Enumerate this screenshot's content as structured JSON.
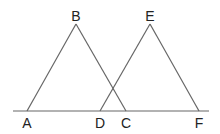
{
  "diagram": {
    "type": "geometry",
    "colors": {
      "line": "#666666",
      "label": "#222222",
      "background": "#ffffff"
    },
    "baseline": {
      "from": [
        13,
        111
      ],
      "to": [
        209,
        111
      ]
    },
    "points": {
      "A": {
        "label": "A",
        "x": 27,
        "y": 111,
        "lx": 27,
        "ly": 123
      },
      "B": {
        "label": "B",
        "x": 76,
        "y": 24,
        "lx": 76,
        "ly": 16
      },
      "C": {
        "label": "C",
        "x": 126,
        "y": 111,
        "lx": 126,
        "ly": 123
      },
      "D": {
        "label": "D",
        "x": 100,
        "y": 111,
        "lx": 100,
        "ly": 123
      },
      "E": {
        "label": "E",
        "x": 150,
        "y": 24,
        "lx": 150,
        "ly": 16
      },
      "F": {
        "label": "F",
        "x": 199,
        "y": 111,
        "lx": 199,
        "ly": 123
      }
    },
    "segments": [
      [
        "A",
        "B"
      ],
      [
        "B",
        "C"
      ],
      [
        "D",
        "E"
      ],
      [
        "E",
        "F"
      ]
    ],
    "triangles": [
      "ABC",
      "DEF"
    ]
  }
}
